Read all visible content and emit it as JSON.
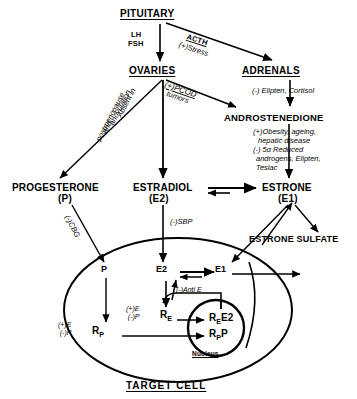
{
  "diagram": {
    "title": "TARGET CELL",
    "organs": {
      "pituitary": "PITUITARY",
      "ovaries": "OVARIES",
      "adrenals": "ADRENALS"
    },
    "hormones": {
      "androstenedione": "ANDROSTENEDIONE",
      "progesterone_name": "PROGESTERONE",
      "progesterone_abbr": "(P)",
      "estradiol_name": "ESTRADIOL",
      "estradiol_abbr": "(E2)",
      "estrone_name": "ESTRONE",
      "estrone_abbr": "(E1)",
      "estrone_sulfate": "ESTRONE  SULFATE"
    },
    "arrow_labels": {
      "lh": "LH",
      "fsh": "FSH",
      "acth": "ACTH",
      "acth_stress": "(+)Stress",
      "pcod": "(+)PCOD",
      "tumors": "tumors",
      "absent_in": "Absent in",
      "anovulation": "anovulation",
      "and": "and",
      "postmenopause": "postmenopause",
      "cbg": "(-)CBG",
      "sbp": "(-)SBP",
      "anti_e": "(-)Anti E"
    },
    "modifiers": {
      "adrenals_inhibit": "(-) Elipten, Cortisol",
      "andro_line1": "(+)Obesity, ageing,",
      "andro_line2": "hepatic disease",
      "andro_line3": "(-) 5α Reduced",
      "andro_line4": "androgens, Elipten,",
      "andro_line5": "Teslac"
    },
    "cell": {
      "p": "P",
      "e2": "E2",
      "e1": "E1",
      "receptor_e": "R",
      "receptor_e_sub": "E",
      "receptor_p": "R",
      "receptor_p_sub": "P",
      "re_plus": "(+)E",
      "re_minus": "(-)P",
      "rp_plus": "(+)E",
      "rp_minus": "(-)P",
      "complex_e": "R",
      "complex_e_sub": "E",
      "complex_e_lig": "E2",
      "complex_p": "R",
      "complex_p_sub": "P",
      "complex_p_lig": "P",
      "nucleus": "Nucleus"
    },
    "colors": {
      "ink": "#000000",
      "background": "#ffffff"
    }
  }
}
